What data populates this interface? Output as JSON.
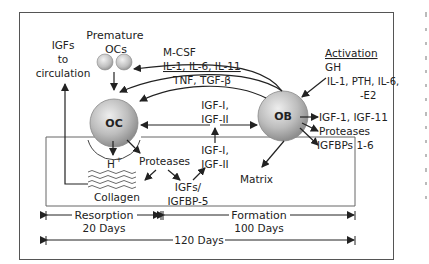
{
  "diagram": {
    "nodes": {
      "oc": "OC",
      "ob": "OB",
      "premature_ocs": [
        "Premature",
        "OCs"
      ]
    },
    "labels": {
      "igfs_to_circulation": [
        "IGFs",
        "to",
        "circulation"
      ],
      "mcsf": "M-CSF",
      "il_line": "IL-1, IL-6, IL-11",
      "tnf_line": "TNF, TGF-β",
      "igf_top": [
        "IGF-I,",
        "IGF-II"
      ],
      "igf_mid": [
        "IGF-I,",
        "IGF-II"
      ],
      "activation_title": "Activation",
      "activation_gh": "GH",
      "activation_factors": [
        "IL-1, PTH, IL-6,",
        "-E2"
      ],
      "ob_outputs": [
        "IGF-1, IGF-11",
        "Proteases",
        "IGFBPs 1-6"
      ],
      "h_plus": "H",
      "h_plus_sup": "+",
      "proteases_oc": "Proteases",
      "collagen": "Collagen",
      "igfs_igfbp5": [
        "IGFs/",
        "IGFBP-5"
      ],
      "matrix": "Matrix"
    },
    "timeline": {
      "resorption": "Resorption",
      "resorption_days": "20 Days",
      "formation": "Formation",
      "formation_days": "100 Days",
      "total": "120 Days"
    }
  }
}
